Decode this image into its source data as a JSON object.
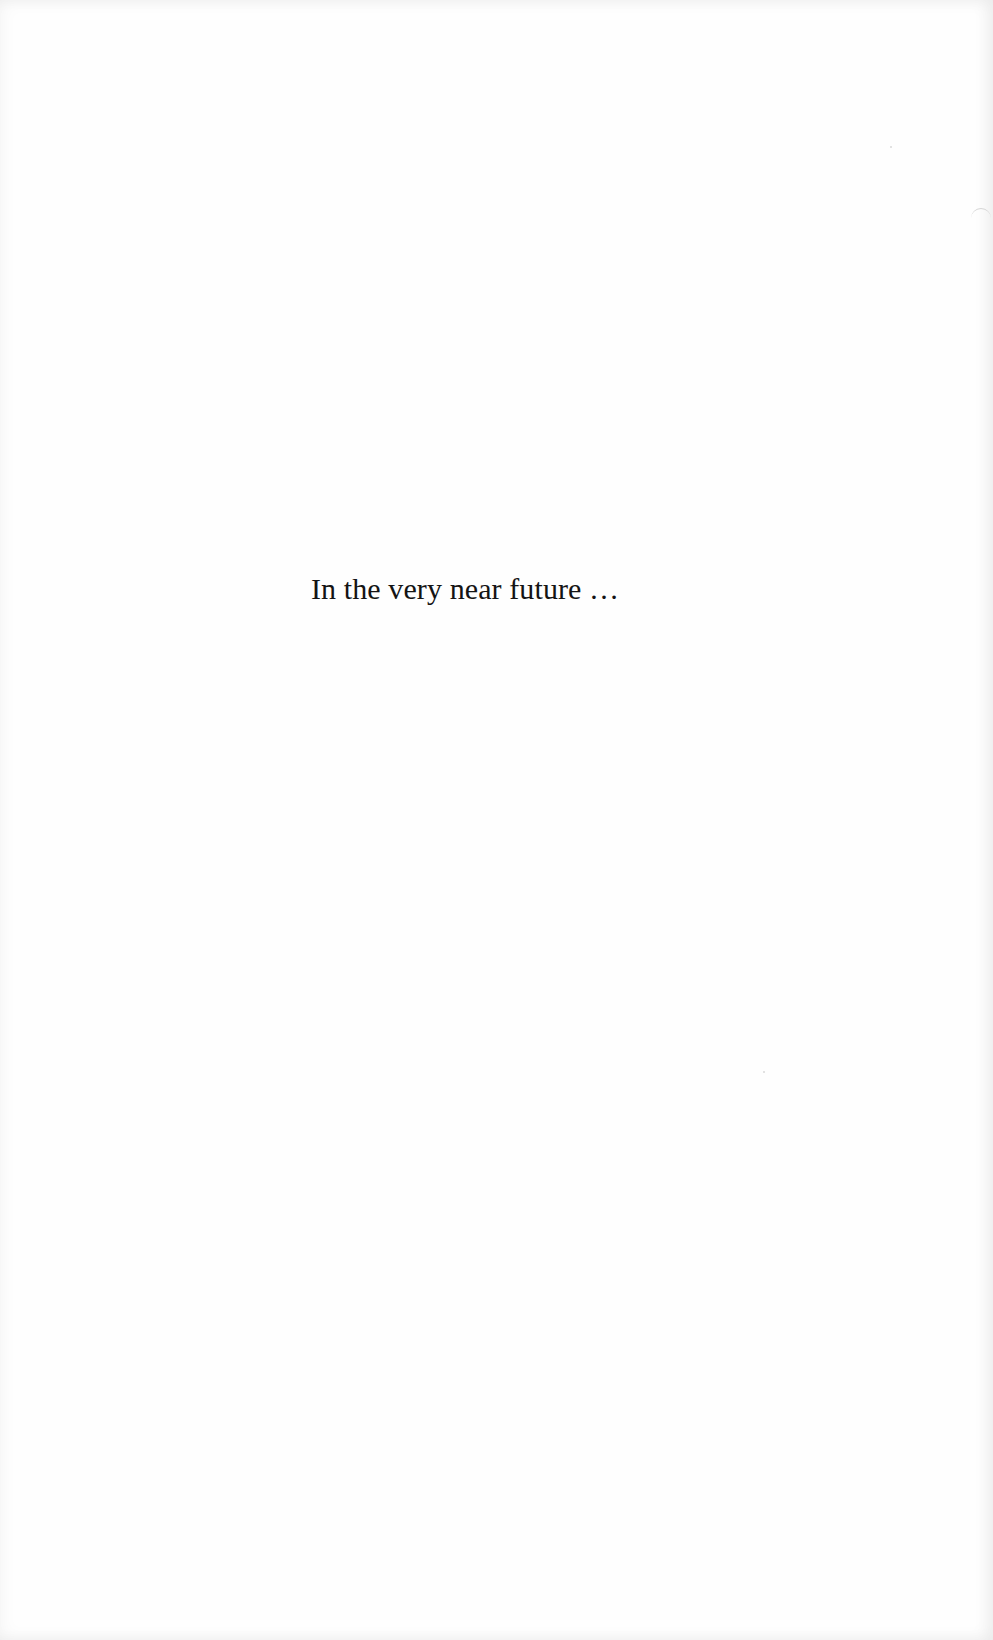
{
  "page": {
    "text": "In the very near future …"
  }
}
